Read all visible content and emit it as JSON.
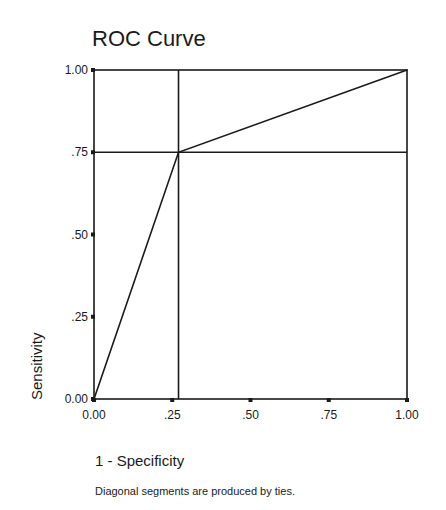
{
  "chart_data": {
    "type": "line",
    "title": "ROC Curve",
    "xlabel": "1 - Specificity",
    "ylabel": "Sensitivity",
    "footnote": "Diagonal segments are produced by ties.",
    "xlim": [
      0,
      1
    ],
    "ylim": [
      0,
      1
    ],
    "x_ticks": [
      0,
      0.25,
      0.5,
      0.75,
      1.0
    ],
    "x_tick_labels": [
      "0.00",
      ".25",
      ".50",
      ".75",
      "1.00"
    ],
    "y_ticks": [
      0,
      0.25,
      0.5,
      0.75,
      1.0
    ],
    "y_tick_labels": [
      "0.00",
      ".25",
      ".50",
      ".75",
      "1.00"
    ],
    "grid": false,
    "series": [
      {
        "name": "ROC",
        "x": [
          0.0,
          0.27,
          1.0
        ],
        "y": [
          0.0,
          0.75,
          1.0
        ]
      }
    ],
    "reference_lines": [
      {
        "orientation": "vertical",
        "value": 0.27
      },
      {
        "orientation": "horizontal",
        "value": 0.75
      }
    ]
  }
}
